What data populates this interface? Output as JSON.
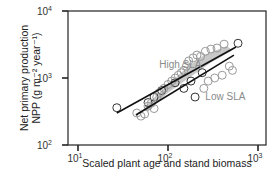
{
  "chart_data": {
    "type": "scatter",
    "title": "",
    "xlabel": "Scaled plant age and stand biomass",
    "ylabel_line1": "Net primary production",
    "ylabel_line2": "NPP (g m⁻² year⁻¹)",
    "xscale": "log",
    "yscale": "log",
    "xlim": [
      10,
      1000
    ],
    "ylim": [
      100,
      10000
    ],
    "x_ticks": [
      {
        "value": 10,
        "base": "10",
        "exp": "1"
      },
      {
        "value": 100,
        "base": "10",
        "exp": "2"
      },
      {
        "value": 1000,
        "base": "10",
        "exp": "3"
      }
    ],
    "y_ticks": [
      {
        "value": 100,
        "base": "10",
        "exp": "2"
      },
      {
        "value": 1000,
        "base": "10",
        "exp": "3"
      },
      {
        "value": 10000,
        "base": "10",
        "exp": "4"
      }
    ],
    "grid": false,
    "legend": "none",
    "annotations": [
      {
        "text": "High SLA",
        "x": 80,
        "y": 1400,
        "color": "#8a8a8a"
      },
      {
        "text": "Low SLA",
        "x": 260,
        "y": 470,
        "color": "#8a8a8a"
      }
    ],
    "series": [
      {
        "name": "High SLA regression",
        "type": "line",
        "color": "#111111",
        "x": [
          27,
          570
        ],
        "y": [
          300,
          2900
        ]
      },
      {
        "name": "Low SLA regression",
        "type": "line",
        "color": "#111111",
        "x": [
          44,
          540
        ],
        "y": [
          280,
          2200
        ]
      },
      {
        "name": "Observations (dark outline)",
        "type": "scatter",
        "marker": "open-circle",
        "color": "#333333",
        "x": [
          27,
          600,
          60,
          70,
          85,
          120,
          150,
          200,
          180,
          240
        ],
        "y": [
          360,
          3300,
          430,
          520,
          650,
          850,
          700,
          520,
          900,
          1200
        ]
      },
      {
        "name": "Observations (gray outline)",
        "type": "scatter",
        "marker": "open-circle",
        "color": "#9a9a9a",
        "x": [
          45,
          50,
          55,
          60,
          65,
          70,
          75,
          80,
          90,
          100,
          110,
          120,
          130,
          140,
          150,
          160,
          170,
          190,
          210,
          230,
          260,
          300,
          350,
          420,
          480,
          520,
          400,
          330,
          280,
          250
        ],
        "y": [
          300,
          270,
          290,
          380,
          420,
          350,
          520,
          600,
          700,
          800,
          900,
          1000,
          1100,
          1200,
          1300,
          1500,
          1800,
          2000,
          2200,
          2100,
          2500,
          2700,
          2800,
          3200,
          1500,
          1300,
          1100,
          1000,
          900,
          700
        ]
      }
    ],
    "shaded_band": {
      "description": "dense gray overlapping markers along High SLA trend",
      "color": "#b5b5b5"
    }
  }
}
